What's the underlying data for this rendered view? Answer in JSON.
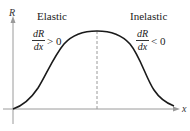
{
  "figure": {
    "y_axis_label": "R",
    "x_axis_label": "x",
    "left_region": {
      "title": "Elastic",
      "derivative_numerator": "dR",
      "derivative_denominator": "dx",
      "relation": "> 0"
    },
    "right_region": {
      "title": "Inelastic",
      "derivative_numerator": "dR",
      "derivative_denominator": "dx",
      "relation": "< 0"
    },
    "colors": {
      "curve": "#1a1a1a",
      "axes": "#9a9a9a",
      "dashed_line": "#9a9a9a"
    }
  }
}
